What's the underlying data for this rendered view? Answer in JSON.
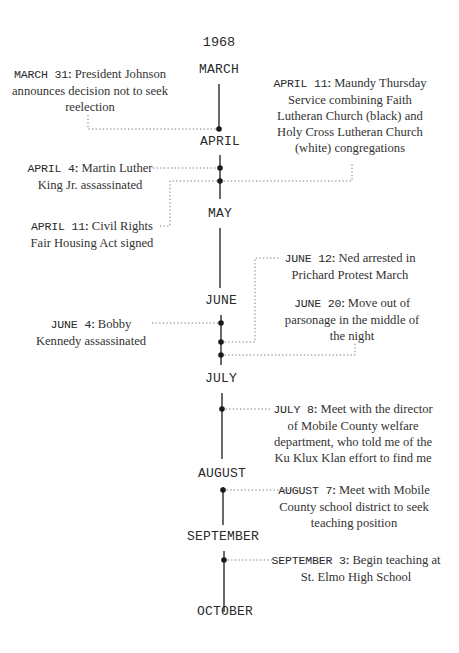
{
  "timeline": {
    "year": "1968",
    "months": [
      {
        "label": "MARCH"
      },
      {
        "label": "APRIL"
      },
      {
        "label": "MAY"
      },
      {
        "label": "JUNE"
      },
      {
        "label": "JULY"
      },
      {
        "label": "AUGUST"
      },
      {
        "label": "SEPTEMBER"
      },
      {
        "label": "OCTOBER"
      }
    ],
    "events": [
      {
        "date": "MARCH 31",
        "separator": ":",
        "text": "President Johnson announces decision not to seek reelection",
        "side": "left"
      },
      {
        "date": "APRIL 11",
        "separator": ":",
        "text": "Maundy Thursday Service combining Faith Lutheran Church (black) and Holy Cross Lutheran Church (white) congregations",
        "side": "right"
      },
      {
        "date": "APRIL 4",
        "separator": ":",
        "text": "Martin Luther King Jr. assassinated",
        "side": "left"
      },
      {
        "date": "APRIL 11",
        "separator": ":",
        "text": "Civil Rights Fair Housing Act signed",
        "side": "left"
      },
      {
        "date": "JUNE 12",
        "separator": ":",
        "text": "Ned arrested in Prichard Protest March",
        "side": "right"
      },
      {
        "date": "JUNE 20",
        "separator": ":",
        "text": "Move out of parsonage in the middle of the night",
        "side": "right"
      },
      {
        "date": "JUNE 4",
        "separator": ":",
        "text": "Bobby Kennedy assassinated",
        "side": "left"
      },
      {
        "date": "JULY 8",
        "separator": ":",
        "text": "Meet with the director of Mobile County welfare department, who told me of the Ku Klux Klan effort to find me",
        "side": "right"
      },
      {
        "date": "AUGUST 7",
        "separator": ":",
        "text": "Meet with Mobile County school district to seek teaching position",
        "side": "right"
      },
      {
        "date": "SEPTEMBER 3",
        "separator": ":",
        "text": "Begin teaching at St. Elmo High School",
        "side": "right"
      }
    ]
  },
  "colors": {
    "line": "#2a2a2a",
    "dot": "#1a1a1a",
    "dotted": "#666666",
    "text": "#333333",
    "background": "#ffffff"
  }
}
